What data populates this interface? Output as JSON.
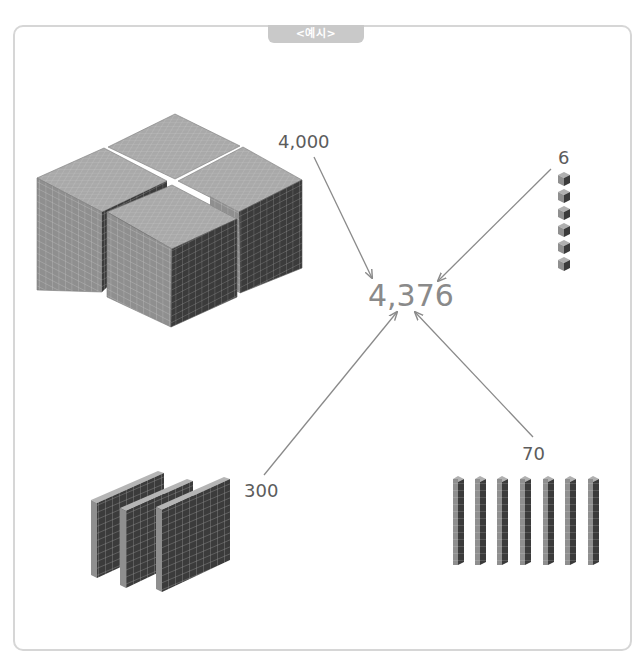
{
  "header": {
    "tab_label": "<예시>"
  },
  "diagram": {
    "total": {
      "label": "4,376",
      "value": 4376
    },
    "components": [
      {
        "place": "thousands",
        "label": "4,000",
        "value": 4000,
        "block_count": 4,
        "block_type": "thousand-cube"
      },
      {
        "place": "hundreds",
        "label": "300",
        "value": 300,
        "block_count": 3,
        "block_type": "hundred-flat"
      },
      {
        "place": "tens",
        "label": "70",
        "value": 70,
        "block_count": 7,
        "block_type": "ten-rod"
      },
      {
        "place": "ones",
        "label": "6",
        "value": 6,
        "block_count": 6,
        "block_type": "unit-cube"
      }
    ],
    "colors": {
      "top_face": "#a9a9a9",
      "left_face": "#8f8f8f",
      "right_face": "#3b3b3b",
      "grid_line": "#d8d8d8",
      "arrow": "#8a8a8a",
      "frame_border": "#d6d6d6",
      "tab_bg": "#c9c9c9"
    }
  }
}
